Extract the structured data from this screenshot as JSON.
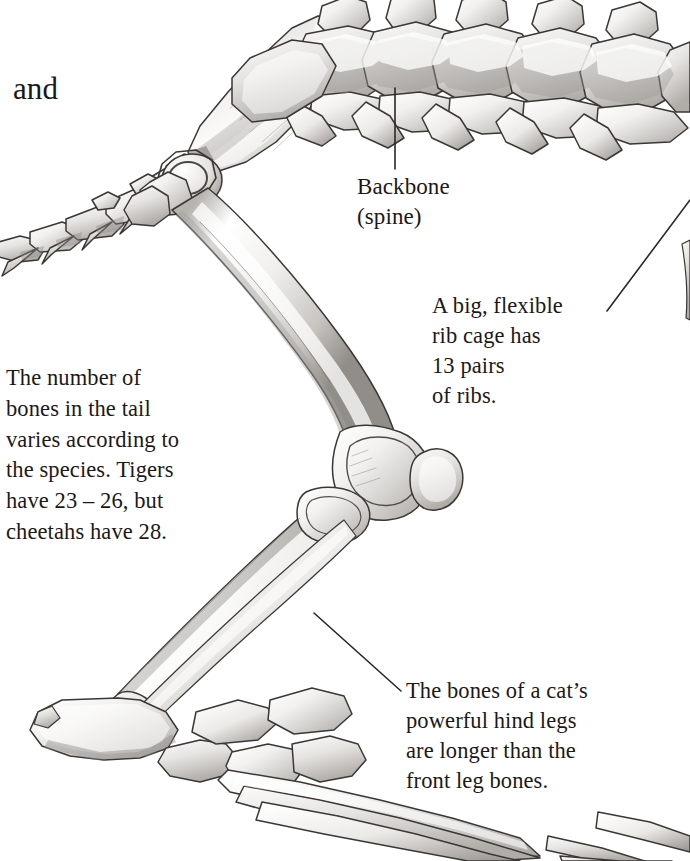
{
  "page": {
    "background_color": "#ffffff",
    "ink_color": "#1b1917",
    "width": 690,
    "height": 861,
    "illustration_style": "graphite pencil shaded line drawing"
  },
  "stray_text": {
    "word": "and"
  },
  "annotations": {
    "backbone": {
      "label": "Backbone\n(spine)",
      "line1": "Backbone",
      "line2": "(spine)"
    },
    "ribcage": {
      "label": "A big, flexible\nrib cage has\n13 pairs\nof ribs.",
      "line1": "A big, flexible",
      "line2": "rib cage has",
      "line3": "13 pairs",
      "line4": "of ribs.",
      "rib_pairs_count": "13"
    },
    "tail": {
      "label": "The number of\nbones in the tail\nvaries according to\nthe species. Tigers\nhave 23 – 26, but\ncheetahs have 28.",
      "line1": "The number of",
      "line2": "bones in the tail",
      "line3": "varies according to",
      "line4": "the species. Tigers",
      "line5": "have 23 – 26, but",
      "line6": "cheetahs have 28.",
      "tiger_tail_bones": "23 – 26",
      "cheetah_tail_bones": "28"
    },
    "hind_legs": {
      "label": "The bones of a cat’s\npowerful hind legs\nare longer than the\nfront leg bones.",
      "line1": "The bones of a cat’s",
      "line2": "powerful hind legs",
      "line3": "are longer than the",
      "line4": "front leg bones."
    }
  },
  "leader_lines": [
    {
      "name": "backbone-leader-line",
      "from": [
        395,
        88
      ],
      "to": [
        395,
        169
      ],
      "color": "#2a2724"
    },
    {
      "name": "ribcage-leader-line",
      "from": [
        607,
        311
      ],
      "to": [
        690,
        200
      ],
      "color": "#2a2724"
    },
    {
      "name": "hindleg-leader-line",
      "from": [
        314,
        613
      ],
      "to": [
        401,
        691
      ],
      "color": "#2a2724"
    }
  ],
  "skeleton_parts": [
    {
      "name": "caudal-vertebrae-tail",
      "description": "tail vertebrae chain at left edge"
    },
    {
      "name": "pelvis-ilium",
      "description": "broad pelvic blade angled down-left"
    },
    {
      "name": "lumbar-thoracic-vertebrae",
      "description": "row of vertebrae with dorsal spines along top"
    },
    {
      "name": "femur",
      "description": "long thigh bone from hip to knee"
    },
    {
      "name": "patella-knee-joint",
      "description": "knee with condyles and kneecap"
    },
    {
      "name": "tibia",
      "description": "shin bone"
    },
    {
      "name": "fibula",
      "description": "slender outer lower-leg bone"
    },
    {
      "name": "calcaneus-hock",
      "description": "heel bone pointing up-left"
    },
    {
      "name": "tarsals-metatarsals-phalanges",
      "description": "foot and toe bones"
    },
    {
      "name": "rib",
      "description": "rib edge at right margin"
    }
  ]
}
